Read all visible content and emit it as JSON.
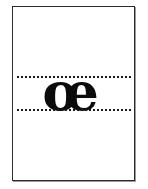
{
  "page": {
    "background_color": "#ffffff",
    "kind": "typography-specimen-plate"
  },
  "frame": {
    "border_color": "#2b2b2b",
    "shadow_color": "#9a9a9a",
    "fill_color": "#ffffff"
  },
  "guides": {
    "style": "dotted",
    "color": "#1b1b1b",
    "lines": [
      {
        "name": "x-height-line",
        "position": "top"
      },
      {
        "name": "baseline",
        "position": "bottom"
      }
    ]
  },
  "glyph": {
    "character": "œ",
    "name": "oe-ligature",
    "color": "#0b0b0b",
    "weight": "bold",
    "style": "serif"
  }
}
